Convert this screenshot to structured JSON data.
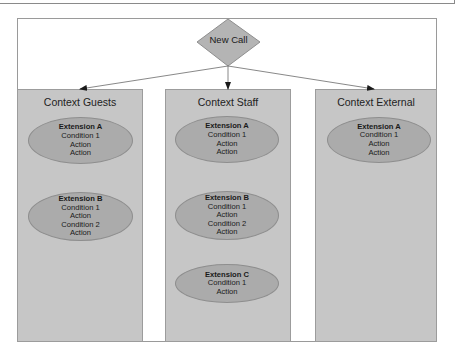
{
  "diagram": {
    "start_node": {
      "label": "New Call",
      "shape": "diamond"
    },
    "colors": {
      "column_fill": "#c6c6c6",
      "extension_fill": "#ababab",
      "diamond_fill": "#b4b4b4",
      "border": "#9a9a9a"
    },
    "contexts": [
      {
        "title": "Context Guests",
        "extensions": [
          {
            "title": "Extension A",
            "lines": [
              "Condition 1",
              "Action",
              "Action"
            ]
          },
          {
            "title": "Extension B",
            "lines": [
              "Condition 1",
              "Action",
              "Condition 2",
              "Action"
            ]
          }
        ]
      },
      {
        "title": "Context Staff",
        "extensions": [
          {
            "title": "Extension A",
            "lines": [
              "Condition 1",
              "Action",
              "Action"
            ]
          },
          {
            "title": "Extension B",
            "lines": [
              "Condition 1",
              "Action",
              "Condition 2",
              "Action"
            ]
          },
          {
            "title": "Extension C",
            "lines": [
              "Condition 1",
              "Action"
            ]
          }
        ]
      },
      {
        "title": "Context External",
        "extensions": [
          {
            "title": "Extension A",
            "lines": [
              "Condition 1",
              "Action",
              "Action"
            ]
          }
        ]
      }
    ],
    "edges": [
      {
        "from": "New Call",
        "to": "Context Guests"
      },
      {
        "from": "New Call",
        "to": "Context Staff"
      },
      {
        "from": "New Call",
        "to": "Context External"
      }
    ]
  }
}
